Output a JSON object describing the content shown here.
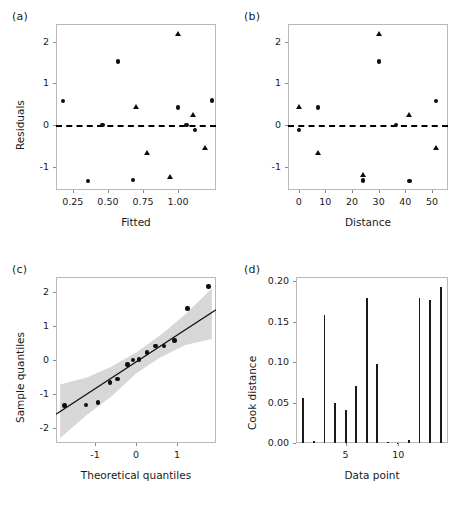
{
  "figure": {
    "panels": [
      "(a)",
      "(b)",
      "(c)",
      "(d)"
    ]
  },
  "chart_data": [
    {
      "panel": "(a)",
      "type": "scatter",
      "title": "",
      "xlabel": "Fitted",
      "ylabel": "Residuals",
      "xlim": [
        0.13,
        1.27
      ],
      "ylim": [
        -1.55,
        2.42
      ],
      "xticks": [
        0.25,
        0.5,
        0.75,
        1.0
      ],
      "xtick_labels": [
        "0.25",
        "0.50",
        "0.75",
        "1.00"
      ],
      "yticks": [
        -1,
        0,
        1,
        2
      ],
      "ytick_labels": [
        "-1",
        "0",
        "1",
        "2"
      ],
      "grid": false,
      "reference_line": {
        "y": 0,
        "style": "dashed"
      },
      "series": [
        {
          "name": "circles",
          "marker": "circle",
          "points": [
            {
              "x": 0.18,
              "y": 0.58
            },
            {
              "x": 0.36,
              "y": -1.33
            },
            {
              "x": 0.46,
              "y": 0.01
            },
            {
              "x": 0.57,
              "y": 1.52
            },
            {
              "x": 0.68,
              "y": -1.31
            },
            {
              "x": 1.0,
              "y": 0.42
            },
            {
              "x": 1.06,
              "y": 0.0
            },
            {
              "x": 1.12,
              "y": -0.12
            },
            {
              "x": 1.24,
              "y": 0.59
            }
          ]
        },
        {
          "name": "triangles",
          "marker": "triangle",
          "points": [
            {
              "x": 0.7,
              "y": 0.43
            },
            {
              "x": 0.78,
              "y": -0.66
            },
            {
              "x": 0.94,
              "y": -1.24
            },
            {
              "x": 1.0,
              "y": 2.17
            },
            {
              "x": 1.11,
              "y": 0.23
            },
            {
              "x": 1.19,
              "y": -0.55
            }
          ]
        }
      ]
    },
    {
      "panel": "(b)",
      "type": "scatter",
      "title": "",
      "xlabel": "Distance",
      "ylabel": "",
      "xlim": [
        -4,
        56
      ],
      "ylim": [
        -1.55,
        2.42
      ],
      "xticks": [
        0,
        10,
        20,
        30,
        40,
        50
      ],
      "xtick_labels": [
        "0",
        "10",
        "20",
        "30",
        "40",
        "50"
      ],
      "yticks": [
        -1,
        0,
        1,
        2
      ],
      "ytick_labels": [
        "-1",
        "0",
        "1",
        "2"
      ],
      "grid": false,
      "reference_line": {
        "y": 0,
        "style": "dashed"
      },
      "series": [
        {
          "name": "circles",
          "marker": "circle",
          "points": [
            {
              "x": 0.2,
              "y": -0.12
            },
            {
              "x": 7.2,
              "y": 0.42
            },
            {
              "x": 24.2,
              "y": -1.32
            },
            {
              "x": 30.2,
              "y": 1.52
            },
            {
              "x": 36.4,
              "y": 0.01
            },
            {
              "x": 41.5,
              "y": -1.34
            },
            {
              "x": 51.4,
              "y": 0.58
            }
          ]
        },
        {
          "name": "triangles",
          "marker": "triangle",
          "points": [
            {
              "x": 0.2,
              "y": 0.43
            },
            {
              "x": 7.2,
              "y": -0.66
            },
            {
              "x": 24.2,
              "y": -1.2
            },
            {
              "x": 30.2,
              "y": 2.18
            },
            {
              "x": 41.5,
              "y": 0.23
            },
            {
              "x": 51.4,
              "y": -0.55
            }
          ]
        }
      ]
    },
    {
      "panel": "(c)",
      "type": "scatter",
      "title": "",
      "xlabel": "Theoretical quantiles",
      "ylabel": "Sample quantiles",
      "xlim": [
        -1.95,
        1.95
      ],
      "ylim": [
        -2.45,
        2.45
      ],
      "xticks": [
        -1,
        0,
        1
      ],
      "xtick_labels": [
        "-1",
        "0",
        "1"
      ],
      "yticks": [
        -2,
        -1,
        0,
        1,
        2
      ],
      "ytick_labels": [
        "-2",
        "-1",
        "0",
        "1",
        "2"
      ],
      "grid": false,
      "reference_line": {
        "slope": 0.79,
        "intercept": -0.06,
        "style": "solid"
      },
      "confidence_band": {
        "fill": "#d7d7d7",
        "upper": [
          {
            "x": -1.85,
            "y": -0.72
          },
          {
            "x": -1.2,
            "y": -0.52
          },
          {
            "x": -0.6,
            "y": -0.2
          },
          {
            "x": 0.0,
            "y": 0.22
          },
          {
            "x": 0.6,
            "y": 0.74
          },
          {
            "x": 1.2,
            "y": 1.34
          },
          {
            "x": 1.85,
            "y": 2.12
          }
        ],
        "lower": [
          {
            "x": -1.85,
            "y": -2.3
          },
          {
            "x": -1.2,
            "y": -1.62
          },
          {
            "x": -0.6,
            "y": -1.08
          },
          {
            "x": 0.0,
            "y": -0.4
          },
          {
            "x": 0.6,
            "y": 0.08
          },
          {
            "x": 1.2,
            "y": 0.44
          },
          {
            "x": 1.85,
            "y": 0.62
          }
        ]
      },
      "points": [
        {
          "x": -1.74,
          "y": -1.34
        },
        {
          "x": -1.22,
          "y": -1.32
        },
        {
          "x": -0.93,
          "y": -1.25
        },
        {
          "x": -0.63,
          "y": -0.66
        },
        {
          "x": -0.45,
          "y": -0.56
        },
        {
          "x": -0.21,
          "y": -0.13
        },
        {
          "x": -0.07,
          "y": 0.0
        },
        {
          "x": 0.08,
          "y": 0.01
        },
        {
          "x": 0.27,
          "y": 0.22
        },
        {
          "x": 0.48,
          "y": 0.42
        },
        {
          "x": 0.68,
          "y": 0.42
        },
        {
          "x": 0.94,
          "y": 0.58
        },
        {
          "x": 1.26,
          "y": 1.52
        },
        {
          "x": 1.77,
          "y": 2.17
        }
      ]
    },
    {
      "panel": "(d)",
      "type": "bar",
      "title": "",
      "xlabel": "Data point",
      "ylabel": "Cook distance",
      "xlim": [
        0.3,
        14.7
      ],
      "ylim": [
        0,
        0.205
      ],
      "xticks": [
        5,
        10
      ],
      "xtick_labels": [
        "5",
        "10"
      ],
      "yticks": [
        0.0,
        0.05,
        0.1,
        0.15,
        0.2
      ],
      "ytick_labels": [
        "0.00",
        "0.05",
        "0.10",
        "0.15",
        "0.20"
      ],
      "grid": false,
      "categories": [
        1,
        2,
        3,
        4,
        5,
        6,
        7,
        8,
        9,
        10,
        11,
        12,
        13,
        14
      ],
      "values": [
        0.055,
        0.002,
        0.158,
        0.05,
        0.041,
        0.071,
        0.179,
        0.097,
        0.001,
        0.0005,
        0.004,
        0.179,
        0.177,
        0.193
      ]
    }
  ]
}
